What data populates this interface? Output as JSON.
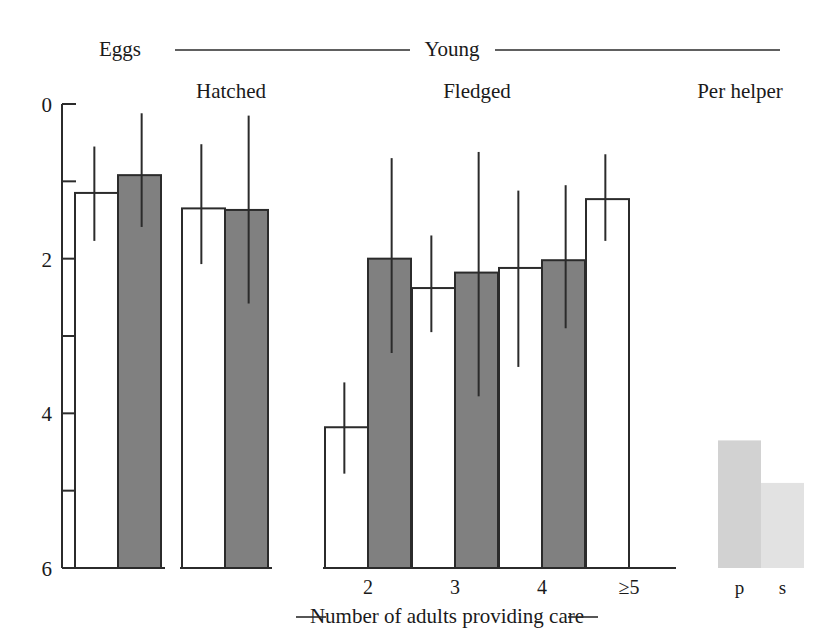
{
  "chart_data": {
    "type": "bar",
    "title": "",
    "xlabel": "Number of adults providing care",
    "ylabel": "",
    "ylim": [
      0,
      6
    ],
    "yticks": [
      0,
      2,
      4,
      6
    ],
    "yticks_minor": [
      1,
      3,
      5
    ],
    "grid": false,
    "legend": "none",
    "group_headers": [
      {
        "label": "Eggs",
        "rule": false
      },
      {
        "label": "Young",
        "rule": true
      },
      {
        "label": "Per helper",
        "rule": false
      }
    ],
    "subgroup_headers": [
      "Hatched",
      "Fledged",
      "Per helper"
    ],
    "categories": [
      "",
      "",
      "2",
      "3",
      "4",
      "≥5"
    ],
    "series": [
      {
        "name": "open",
        "style": "white",
        "values": [
          4.85,
          4.65,
          1.82,
          3.62,
          3.88,
          4.77
        ],
        "err_low": [
          4.23,
          3.93,
          1.22,
          3.05,
          2.6,
          4.23
        ],
        "err_high": [
          5.45,
          5.48,
          2.4,
          4.3,
          4.88,
          5.35
        ]
      },
      {
        "name": "filled",
        "style": "gray",
        "values": [
          5.08,
          4.63,
          4.0,
          3.82,
          3.98,
          null
        ],
        "err_low": [
          4.41,
          3.42,
          2.78,
          2.22,
          3.1,
          null
        ],
        "err_high": [
          5.88,
          5.85,
          5.3,
          5.38,
          4.95,
          null
        ]
      }
    ],
    "per_helper": {
      "categories": [
        "p",
        "s"
      ],
      "values": [
        1.65,
        1.1
      ],
      "colors": [
        "#d2d2d2",
        "#e2e2e2"
      ]
    },
    "colors": {
      "open_fill": "#ffffff",
      "filled_fill": "#808080",
      "stroke": "#2b2b2b",
      "text": "#1a1a1a"
    }
  },
  "axis": {
    "tick_texts": [
      "6",
      "4",
      "2",
      "0"
    ]
  },
  "labels": {
    "eggs": "Eggs",
    "young": "Young",
    "hatched": "Hatched",
    "fledged": "Fledged",
    "per_helper": "Per helper",
    "cat_2": "2",
    "cat_3": "3",
    "cat_4": "4",
    "cat_5": "≥5",
    "ph_p": "p",
    "ph_s": "s",
    "xaxis_title": "Number of adults providing care"
  }
}
